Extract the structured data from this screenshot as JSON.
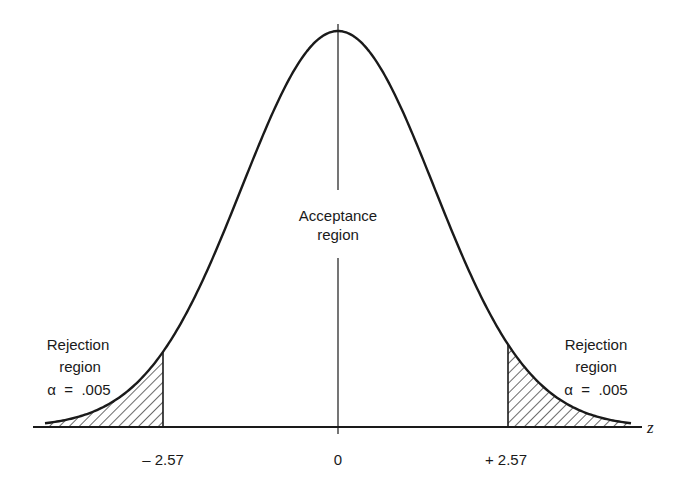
{
  "figure": {
    "type": "normal-distribution-two-tailed-test",
    "axis_label": "z",
    "center_label": {
      "line1": "Acceptance",
      "line2": "region"
    },
    "left_tail": {
      "line1": "Rejection",
      "line2": "region",
      "line3": "α  =  .005",
      "critical_value_label": "– 2.57",
      "critical_value": -2.57,
      "alpha": 0.005
    },
    "right_tail": {
      "line1": "Rejection",
      "line2": "region",
      "line3": "α  =  .005",
      "critical_value_label": "+ 2.57",
      "critical_value": 2.57,
      "alpha": 0.005
    },
    "mean_label": "0"
  },
  "colors": {
    "ink": "#1a1a1a",
    "background": "#ffffff"
  }
}
